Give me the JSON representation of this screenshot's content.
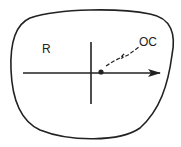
{
  "diagram": {
    "labels": {
      "region": "R",
      "optical_center": "OC"
    },
    "colors": {
      "stroke": "#222222",
      "background": "#ffffff"
    }
  }
}
